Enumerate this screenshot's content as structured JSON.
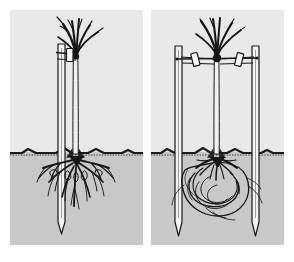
{
  "figure": {
    "type": "botanical-line-illustration",
    "background_color": "#ffffff",
    "panel_count": 2,
    "caption": ""
  },
  "palette": {
    "page_background": "#ffffff",
    "sky_background": "#e9e9e9",
    "soil_background": "#c9c9c9",
    "ink": "#151515",
    "ink_soft": "#2b2b2b",
    "stake_fill": "#f2f2f2",
    "stake_outline": "#1a1a1a",
    "ground_line": "#1a1a1a"
  },
  "geometry": {
    "panel_width": 133,
    "panel_height": 235,
    "ground_y": 142,
    "trunk_x": 66
  },
  "panels": [
    {
      "id": "panel-left",
      "label": "Single stake with bare-root tree",
      "above_ground": {
        "tree": {
          "label": "young deciduous tree",
          "trunk": "single straight leader",
          "branch_count": 6,
          "crown_spread": "narrow upright"
        },
        "stake": {
          "label": "single vertical stake",
          "count": 1,
          "position": "left of trunk",
          "tie_count": 1,
          "tie_label": "buckle tie with spacer"
        }
      },
      "below_ground": {
        "root_system": {
          "label": "bare-root fibrous root system",
          "type": "fibrous",
          "spread": "wide radiating",
          "depth": "shallow to medium"
        },
        "stake_tip": "pointed stake driven below root zone"
      }
    },
    {
      "id": "panel-right",
      "label": "Double stake with root-balled tree",
      "above_ground": {
        "tree": {
          "label": "young deciduous tree",
          "trunk": "single straight leader",
          "branch_count": 6,
          "crown_spread": "narrow upright"
        },
        "stake": {
          "label": "pair of vertical stakes with crossbar",
          "count": 2,
          "position": "either side of trunk",
          "tie_count": 2,
          "tie_label": "buckle ties with spacers",
          "crossbar": "horizontal rail between stakes"
        }
      },
      "below_ground": {
        "root_system": {
          "label": "container root ball with circling roots",
          "type": "girdling / circling",
          "spread": "confined to root ball",
          "depth": "shallow pan"
        },
        "stake_tip": "pointed stakes driven outside the root ball"
      }
    }
  ]
}
